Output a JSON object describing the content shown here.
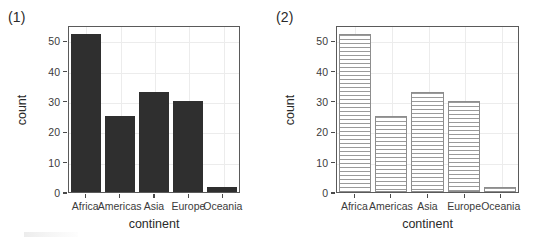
{
  "figure": {
    "panels": [
      {
        "tag": "(1)",
        "fill_style": "solid",
        "fill_color": "#2f2f2f"
      },
      {
        "tag": "(2)",
        "fill_style": "horizontal-stripes",
        "fill_color": "#fbfbfb",
        "stripe_color": "#9a9a9a",
        "border_color": "#8d8d8d"
      }
    ]
  },
  "chart_data": [
    {
      "type": "bar",
      "title": "(1)",
      "categories": [
        "Africa",
        "Americas",
        "Asia",
        "Europe",
        "Oceania"
      ],
      "values": [
        52,
        25,
        33,
        30,
        1.5
      ],
      "xlabel": "continent",
      "ylabel": "count",
      "ylim": [
        0,
        55
      ],
      "yticks": [
        0,
        10,
        20,
        30,
        40,
        50
      ],
      "ytick_labels": [
        "0",
        "10",
        "20",
        "30",
        "40",
        "50"
      ],
      "grid": true,
      "legend": "none"
    },
    {
      "type": "bar",
      "title": "(2)",
      "categories": [
        "Africa",
        "Americas",
        "Asia",
        "Europe",
        "Oceania"
      ],
      "values": [
        52,
        25,
        33,
        30,
        1.5
      ],
      "xlabel": "continent",
      "ylabel": "count",
      "ylim": [
        0,
        55
      ],
      "yticks": [
        0,
        10,
        20,
        30,
        40,
        50
      ],
      "ytick_labels": [
        "0",
        "10",
        "20",
        "30",
        "40",
        "50"
      ],
      "grid": true,
      "legend": "none"
    }
  ]
}
